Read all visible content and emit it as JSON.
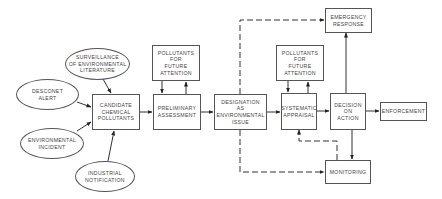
{
  "diagram": {
    "inputs": [
      {
        "id": "surveillance",
        "label": "SURVEILLANCE\nOF ENVIRONMENTAL\nLITERATURE"
      },
      {
        "id": "desconet",
        "label": "DESCONET\nALERT"
      },
      {
        "id": "environmental_incident",
        "label": "ENVIRONMENTAL\nINCIDENT"
      },
      {
        "id": "industrial",
        "label": "INDUSTRIAL\nNOTIFICATION"
      }
    ],
    "boxes": {
      "candidate": "CANDIDATE\nCHEMICAL\nPOLLUTANTS",
      "pollutants1": "POLLUTANTS\nFOR\nFUTURE\nATTENTION",
      "preliminary": "PRELIMINARY\nASSESSMENT",
      "designation": "DESIGNATION\nAS\nENVIRONMENTAL\nISSUE",
      "pollutants2": "POLLUTANTS\nFOR\nFUTURE\nATTENTION",
      "systematic": "SYSTEMATIC\nAPPRAISAL",
      "decision": "DECISION\nON\nACTION",
      "emergency": "EMERGENCY\nRESPONSE",
      "enforcement": "ENFORCEMENT",
      "monitoring": "MONITORING"
    },
    "edges": [
      {
        "from": "surveillance",
        "to": "candidate",
        "style": "solid"
      },
      {
        "from": "desconet",
        "to": "candidate",
        "style": "solid"
      },
      {
        "from": "environmental_incident",
        "to": "candidate",
        "style": "solid"
      },
      {
        "from": "industrial",
        "to": "candidate",
        "style": "solid"
      },
      {
        "from": "candidate",
        "to": "preliminary",
        "style": "solid"
      },
      {
        "from": "pollutants1",
        "to": "preliminary",
        "style": "solid"
      },
      {
        "from": "preliminary",
        "to": "pollutants1",
        "style": "solid"
      },
      {
        "from": "preliminary",
        "to": "designation",
        "style": "solid"
      },
      {
        "from": "designation",
        "to": "systematic",
        "style": "solid"
      },
      {
        "from": "pollutants2",
        "to": "systematic",
        "style": "solid"
      },
      {
        "from": "systematic",
        "to": "pollutants2",
        "style": "solid"
      },
      {
        "from": "systematic",
        "to": "decision",
        "style": "solid"
      },
      {
        "from": "decision",
        "to": "emergency",
        "style": "solid"
      },
      {
        "from": "decision",
        "to": "enforcement",
        "style": "solid"
      },
      {
        "from": "decision",
        "to": "monitoring",
        "style": "solid"
      },
      {
        "from": "designation",
        "to": "emergency",
        "style": "dashed"
      },
      {
        "from": "designation",
        "to": "monitoring",
        "style": "dashed"
      },
      {
        "from": "monitoring",
        "to": "systematic",
        "style": "dashed"
      }
    ]
  }
}
